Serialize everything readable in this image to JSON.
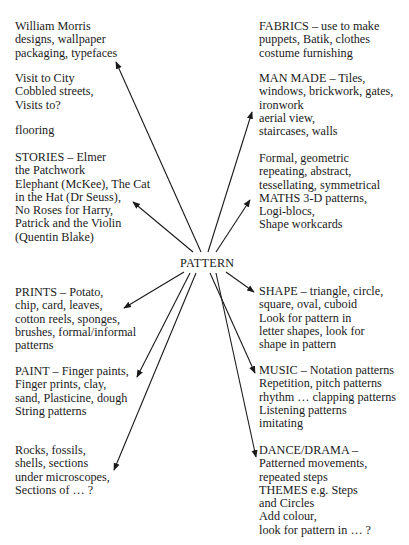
{
  "diagram": {
    "center": "PATTERN",
    "left_nodes": [
      {
        "id": "william-morris",
        "lines": [
          "William Morris",
          "designs, wallpaper",
          "packaging, typefaces"
        ]
      },
      {
        "id": "visit-city",
        "lines": [
          "Visit to City",
          "Cobbled streets,",
          "Visits to?"
        ]
      },
      {
        "id": "flooring",
        "lines": [
          "flooring"
        ]
      },
      {
        "id": "stories",
        "lines": [
          "STORIES – Elmer",
          "the Patchwork",
          "Elephant (McKee), The Cat",
          "in the Hat (Dr Seuss),",
          "No Roses for Harry,",
          "Patrick and the Violin",
          "(Quentin Blake)"
        ]
      },
      {
        "id": "prints",
        "lines": [
          "PRINTS – Potato,",
          "chip, card, leaves,",
          "cotton reels, sponges,",
          "brushes, formal/informal",
          "patterns"
        ]
      },
      {
        "id": "paint",
        "lines": [
          "PAINT – Finger paints,",
          "Finger prints, clay,",
          "sand, Plasticine, dough",
          "String patterns"
        ]
      },
      {
        "id": "rocks",
        "lines": [
          "Rocks, fossils,",
          "shells, sections",
          "under microscopes,",
          "Sections of … ?"
        ]
      }
    ],
    "right_nodes": [
      {
        "id": "fabrics",
        "lines": [
          "FABRICS – use to make",
          "puppets, Batik, clothes",
          "costume furnishing"
        ]
      },
      {
        "id": "man-made",
        "lines": [
          "MAN MADE – Tiles,",
          "windows, brickwork, gates,",
          "ironwork",
          "aerial view,",
          "staircases, walls"
        ]
      },
      {
        "id": "maths",
        "lines": [
          "Formal, geometric",
          "repeating, abstract,",
          "tessellating, symmetrical",
          "MATHS 3-D patterns,",
          "Logi-blocs,",
          "Shape workcards"
        ]
      },
      {
        "id": "shape",
        "lines": [
          "SHAPE – triangle, circle,",
          "square, oval, cuboid",
          "Look for pattern in",
          "letter shapes, look for",
          "shape in pattern"
        ]
      },
      {
        "id": "music",
        "lines": [
          "MUSIC – Notation patterns",
          "Repetition, pitch patterns",
          "rhythm … clapping patterns",
          "Listening patterns",
          "imitating"
        ]
      },
      {
        "id": "dance",
        "lines": [
          "DANCE/DRAMA –",
          "Patterned movements,",
          "repeated steps",
          "THEMES e.g. Steps",
          "and Circles",
          "Add colour,",
          "look for pattern in … ?"
        ]
      }
    ],
    "arrows": [
      {
        "to": "william-morris",
        "from": [
          201,
          252
        ],
        "tip": [
          116,
          62
        ]
      },
      {
        "to": "man-made",
        "from": [
          208,
          252
        ],
        "tip": [
          252,
          112
        ]
      },
      {
        "to": "stories",
        "from": [
          193,
          252
        ],
        "tip": [
          133,
          202
        ]
      },
      {
        "to": "maths",
        "from": [
          216,
          252
        ],
        "tip": [
          250,
          200
        ]
      },
      {
        "to": "prints",
        "from": [
          184,
          272
        ],
        "tip": [
          124,
          308
        ]
      },
      {
        "to": "paint",
        "from": [
          190,
          273
        ],
        "tip": [
          137,
          377
        ]
      },
      {
        "to": "rocks",
        "from": [
          196,
          273
        ],
        "tip": [
          114,
          470
        ]
      },
      {
        "to": "music",
        "from": [
          210,
          273
        ],
        "tip": [
          255,
          373
        ]
      },
      {
        "to": "dance",
        "from": [
          216,
          273
        ],
        "tip": [
          256,
          457
        ]
      },
      {
        "to": "shape",
        "from": [
          226,
          272
        ],
        "tip": [
          254,
          292
        ]
      }
    ],
    "colors": {
      "text": "#1a1a1a",
      "arrow": "#1a1a1a",
      "background": "#ffffff"
    }
  }
}
